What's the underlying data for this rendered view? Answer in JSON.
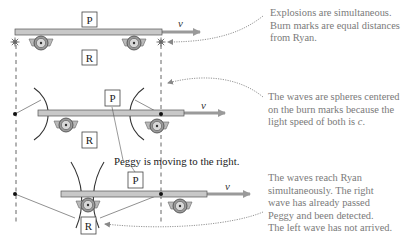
{
  "frames": [
    {
      "id": "explosion",
      "labels": {
        "peggy": "P",
        "ryan": "R",
        "velocity": "v"
      },
      "note": {
        "lines": [
          "Explosions are simultaneous.",
          "Burn marks are equal distances",
          "from Ryan."
        ]
      }
    },
    {
      "id": "waves-expanding",
      "labels": {
        "peggy": "P",
        "ryan": "R",
        "velocity": "v"
      },
      "note": {
        "lines": [
          "The waves are spheres centered",
          "on the burn marks because the",
          "light speed of both is "
        ],
        "italic_tail": "c",
        "tail_end": "."
      },
      "caption": "Peggy is moving to the right."
    },
    {
      "id": "waves-reach-ryan",
      "labels": {
        "peggy": "P",
        "ryan": "R",
        "velocity": "v"
      },
      "note": {
        "lines": [
          "The waves reach Ryan",
          "simultaneously. The right",
          "wave has already passed",
          "Peggy and been detected.",
          "The left wave has not arrived."
        ]
      }
    }
  ],
  "colors": {
    "platform_fill": "#c8c8c8",
    "platform_stroke": "#555555",
    "arrow": "#9a9a9a",
    "wheel_outer": "#9a9a9a",
    "wave_arc": "#333333",
    "note_text": "#7a7a7a",
    "dashed_line": "#555555"
  }
}
